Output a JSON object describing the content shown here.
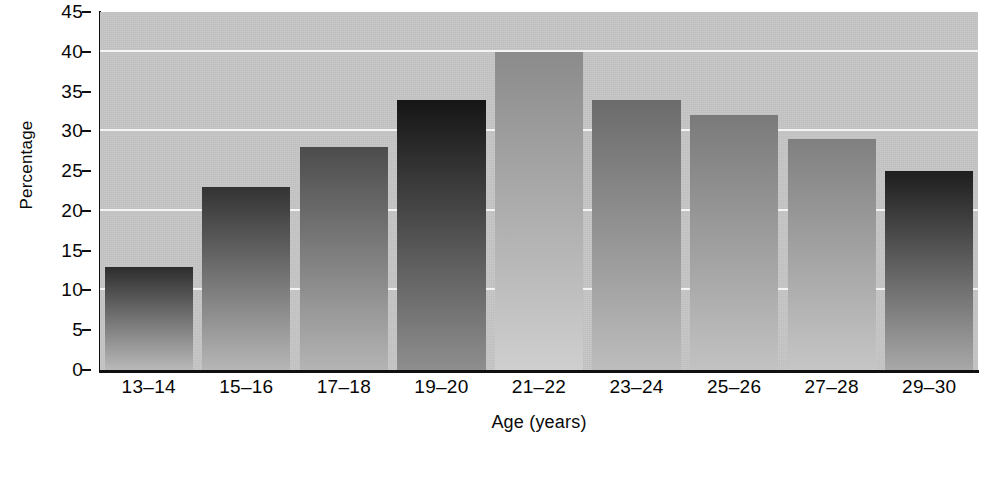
{
  "chart_data": {
    "type": "bar",
    "title": "",
    "xlabel": "Age (years)",
    "ylabel": "Percentage",
    "categories": [
      "13–14",
      "15–16",
      "17–18",
      "19–20",
      "21–22",
      "23–24",
      "25–26",
      "27–28",
      "29–30"
    ],
    "values": [
      13,
      23,
      28,
      34,
      40,
      34,
      32,
      29,
      25
    ],
    "ylim": [
      0,
      45
    ],
    "ytick_labels": [
      "0",
      "5",
      "10",
      "15",
      "20",
      "25",
      "30",
      "35",
      "40",
      "45"
    ],
    "ytick_values": [
      0,
      5,
      10,
      15,
      20,
      25,
      30,
      35,
      40,
      45
    ],
    "gridlines_at": [
      10,
      20,
      30,
      40
    ],
    "grid": true,
    "legend": "none",
    "bar_fills": [
      {
        "category": "13–14",
        "top": "#2d2d2d",
        "bottom": "#b9b9b9"
      },
      {
        "category": "15–16",
        "top": "#333333",
        "bottom": "#b6b6b6"
      },
      {
        "category": "17–18",
        "top": "#4c4c4c",
        "bottom": "#b4b4b4"
      },
      {
        "category": "19–20",
        "top": "#151515",
        "bottom": "#8e8e8e"
      },
      {
        "category": "21–22",
        "top": "#8b8b8b",
        "bottom": "#cfcfcf"
      },
      {
        "category": "23–24",
        "top": "#6b6b6b",
        "bottom": "#bdbdbd"
      },
      {
        "category": "25–26",
        "top": "#7a7a7a",
        "bottom": "#c2c2c2"
      },
      {
        "category": "27–28",
        "top": "#808080",
        "bottom": "#c6c6c6"
      },
      {
        "category": "29–30",
        "top": "#1e1e1e",
        "bottom": "#a8a8a8"
      }
    ],
    "plot_background": "#c6c6c6",
    "gridline_color": "#f4f4f4",
    "axis_color": "#101010"
  }
}
